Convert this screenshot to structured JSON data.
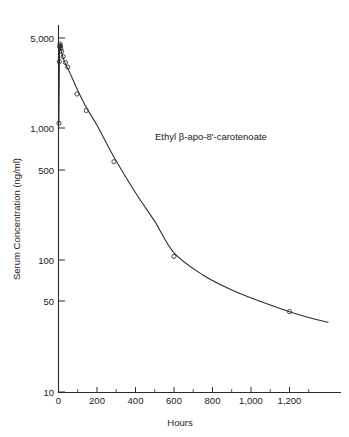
{
  "chart_data": {
    "type": "line",
    "title": "",
    "annotation": "Ethyl β-apo-8'-carotenoate",
    "xlabel": "Hours",
    "ylabel": "Serum Concentration (ng/ml)",
    "xscale": "linear",
    "yscale": "log",
    "xlim": [
      0,
      1400
    ],
    "ylim": [
      10,
      6600
    ],
    "grid": false,
    "legend": null,
    "xticks": [
      0,
      200,
      400,
      600,
      800,
      1000,
      1200
    ],
    "xticklabels": [
      "0",
      "200",
      "400",
      "600",
      "800",
      "1,000",
      "1,200"
    ],
    "xminorticks": [
      100,
      300,
      500,
      700,
      900,
      1100,
      1300
    ],
    "yticks": [
      5000,
      1000,
      500,
      100,
      50,
      10
    ],
    "yticklabels": [
      "5,000",
      "1,000",
      "500",
      "100",
      "50",
      "10"
    ],
    "series": [
      {
        "name": "Ethyl β-apo-8'-carotenoate",
        "marker": "open-circle",
        "x": [
          2,
          4,
          6,
          8,
          10,
          12,
          16,
          24,
          36,
          48,
          96,
          144,
          288,
          600,
          1200
        ],
        "y": [
          1120,
          3300,
          4300,
          4500,
          4350,
          4150,
          3950,
          3600,
          3250,
          3000,
          1870,
          1400,
          570,
          108,
          41
        ],
        "units": "ng/ml"
      }
    ],
    "fit_curve_points": [
      [
        2,
        1120
      ],
      [
        5,
        3500
      ],
      [
        8,
        4500
      ],
      [
        12,
        4200
      ],
      [
        18,
        3800
      ],
      [
        26,
        3450
      ],
      [
        40,
        3100
      ],
      [
        60,
        2700
      ],
      [
        96,
        2050
      ],
      [
        144,
        1480
      ],
      [
        200,
        1080
      ],
      [
        288,
        620
      ],
      [
        400,
        330
      ],
      [
        500,
        200
      ],
      [
        600,
        115
      ],
      [
        750,
        78
      ],
      [
        900,
        60
      ],
      [
        1050,
        49
      ],
      [
        1200,
        41
      ],
      [
        1300,
        37
      ],
      [
        1400,
        34
      ]
    ]
  },
  "axis_titles": {
    "x": "Hours",
    "y": "Serum Concentration (ng/ml)"
  },
  "annotation": {
    "text": "Ethyl β-apo-8'-carotenoate"
  },
  "colors": {
    "axis": "#2b2b2b",
    "curve": "#2b2b2b",
    "marker": "#2b2b2b",
    "background": "#ffffff",
    "text": "#1a1a1a"
  }
}
